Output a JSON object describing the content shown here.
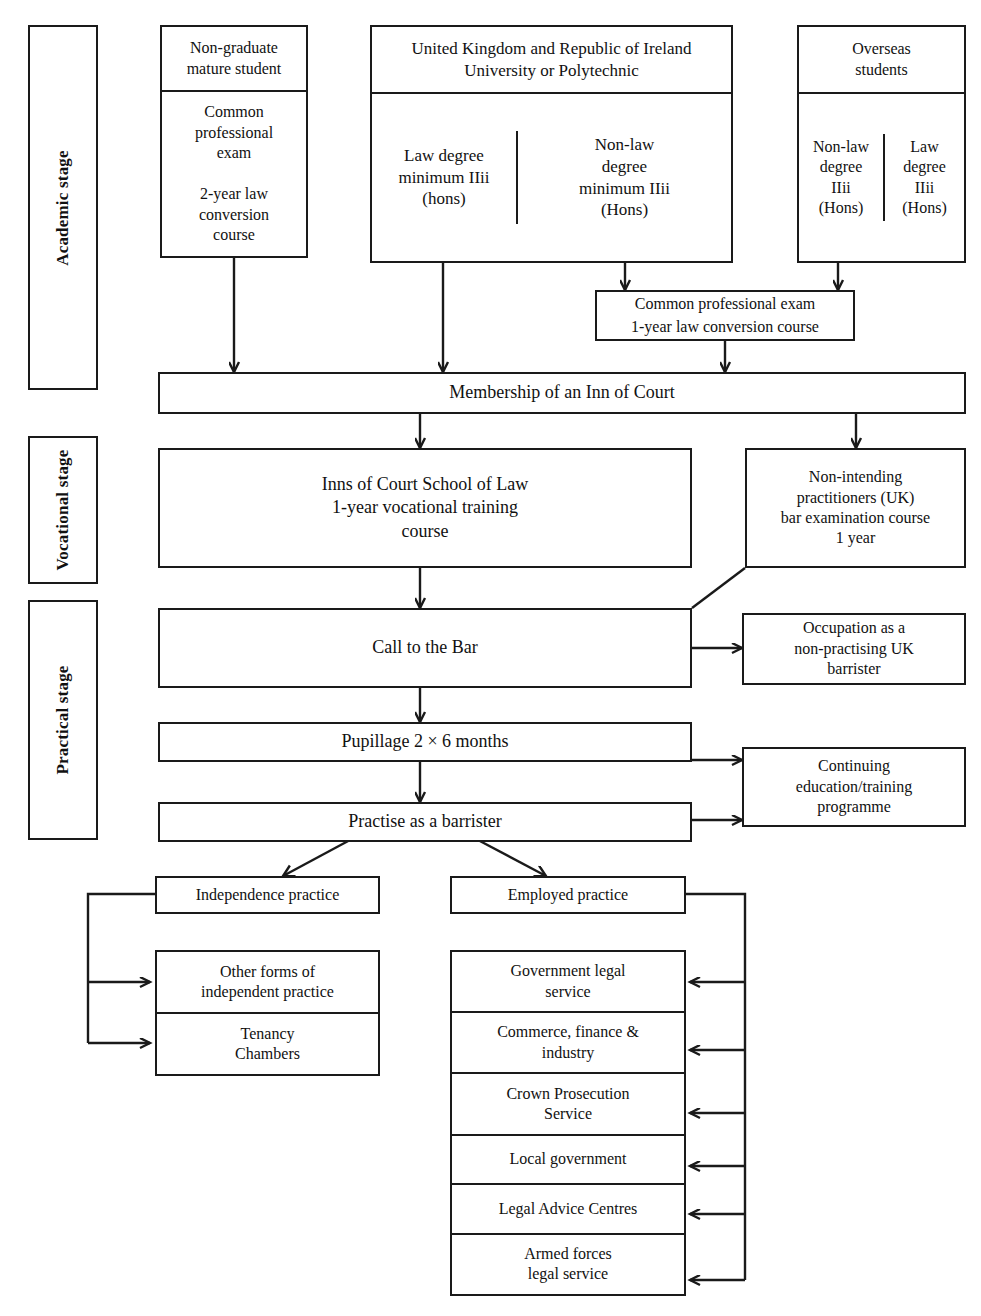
{
  "diagram": {
    "stages": [
      {
        "id": "academic",
        "label": "Academic stage"
      },
      {
        "id": "vocational",
        "label": "Vocational stage"
      },
      {
        "id": "practical",
        "label": "Practical stage"
      }
    ],
    "nodes": {
      "non_graduate": {
        "header": "Non-graduate\nmature student",
        "body": "Common\nprofessional\nexam\n\n2-year law\nconversion\ncourse"
      },
      "uk_ireland": {
        "header": "United Kingdom and Republic of Ireland\nUniversity or Polytechnic",
        "left": "Law degree\nminimum IIii\n(hons)",
        "right": "Non-law\ndegree\nminimum IIii\n(Hons)"
      },
      "overseas": {
        "header": "Overseas\nstudents",
        "left": "Non-law\ndegree\nIIii\n(Hons)",
        "right": "Law\ndegree\nIIii\n(Hons)"
      },
      "cpe": {
        "line1": "Common professional exam",
        "line2": "1-year law conversion course"
      },
      "inn_membership": {
        "label": "Membership of an Inn of Court"
      },
      "icsl": {
        "label": "Inns of Court School of Law\n1-year vocational training\ncourse"
      },
      "non_intending": {
        "label": "Non-intending\npractitioners (UK)\nbar examination course\n1 year"
      },
      "call_to_bar": {
        "label": "Call to the Bar"
      },
      "non_practising": {
        "label": "Occupation as a\nnon-practising UK\nbarrister"
      },
      "pupillage": {
        "label": "Pupillage 2 × 6 months"
      },
      "practise": {
        "label": "Practise as a barrister"
      },
      "continuing": {
        "label": "Continuing\neducation/training\nprogramme"
      },
      "independence": {
        "label": "Independence practice"
      },
      "employed": {
        "label": "Employed practice"
      },
      "other_forms": {
        "label": "Other forms of\nindependent practice"
      },
      "tenancy": {
        "label": "Tenancy\nChambers"
      }
    },
    "employed_practice_options": [
      "Government legal\nservice",
      "Commerce, finance &\nindustry",
      "Crown Prosecution\nService",
      "Local government",
      "Legal Advice Centres",
      "Armed forces\nlegal service"
    ],
    "colors": {
      "stroke": "#1a1a1a",
      "fill": "#ffffff",
      "text": "#111111"
    }
  }
}
